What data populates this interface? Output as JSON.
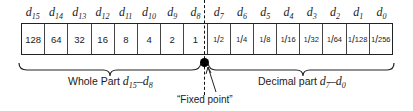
{
  "bit_labels": [
    {
      "base": "d",
      "sub": "15"
    },
    {
      "base": "d",
      "sub": "14"
    },
    {
      "base": "d",
      "sub": "13"
    },
    {
      "base": "d",
      "sub": "12"
    },
    {
      "base": "d",
      "sub": "11"
    },
    {
      "base": "d",
      "sub": "10"
    },
    {
      "base": "d",
      "sub": "9"
    },
    {
      "base": "d",
      "sub": "8"
    },
    {
      "base": "d",
      "sub": "7"
    },
    {
      "base": "d",
      "sub": "6"
    },
    {
      "base": "d",
      "sub": "5"
    },
    {
      "base": "d",
      "sub": "4"
    },
    {
      "base": "d",
      "sub": "3"
    },
    {
      "base": "d",
      "sub": "2"
    },
    {
      "base": "d",
      "sub": "1"
    },
    {
      "base": "d",
      "sub": "0"
    }
  ],
  "whole_values": [
    "128",
    "64",
    "32",
    "16",
    "8",
    "4",
    "2",
    "1"
  ],
  "fraction_values": [
    {
      "num": "1",
      "den": "2"
    },
    {
      "num": "1",
      "den": "4"
    },
    {
      "num": "1",
      "den": "8"
    },
    {
      "num": "1",
      "den": "16"
    },
    {
      "num": "1",
      "den": "32"
    },
    {
      "num": "1",
      "den": "64"
    },
    {
      "num": "1",
      "den": "128"
    },
    {
      "num": "1",
      "den": "256"
    }
  ],
  "captions": {
    "whole": {
      "text": "Whole Part ",
      "range": {
        "from": "15",
        "to": "8"
      }
    },
    "decimal": {
      "text": "Decimal part ",
      "range": {
        "from": "7",
        "to": "0"
      }
    },
    "fixed_point": "“Fixed point”"
  }
}
